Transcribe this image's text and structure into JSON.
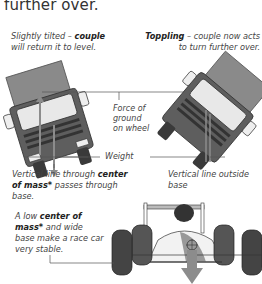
{
  "heading": "further over.",
  "captions": {
    "left_top": {
      "pre": "Slightly tilted – ",
      "bold": "couple",
      "post": " will return it to level."
    },
    "right_top": {
      "bold": "Toppling",
      "post": " – couple now acts to turn further over."
    },
    "left_bottom": {
      "pre": "Vertical line through ",
      "bold": "center of mass*",
      "post": " passes through base."
    },
    "right_bottom": {
      "text": "Vertical line outside base"
    },
    "race_car": {
      "pre": "A low ",
      "bold": "center of mass*",
      "post": " and wide base make a race car very stable."
    }
  },
  "labels": {
    "force_line1": "Force of",
    "force_line2": "ground",
    "force_line3": "on wheel",
    "weight": "Weight"
  },
  "colors": {
    "truck_body": "#8a8a8a",
    "truck_cab": "#6e6e6e",
    "arrow": "#8c8c8c",
    "line": "#555555",
    "tyre": "#3a3a3a"
  }
}
